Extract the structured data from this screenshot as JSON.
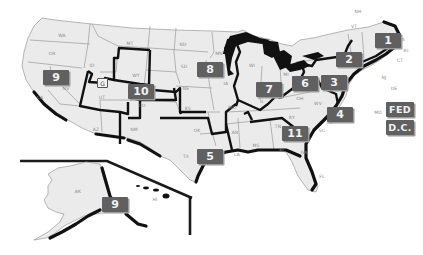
{
  "map": {
    "type": "US regional map",
    "colors": {
      "background": "#ffffff",
      "state_fill": "#ebebeb",
      "state_border": "#9a9a9a",
      "region_border": "#111111",
      "badge_fill": "#606060",
      "badge_text": "#f2f2f2"
    },
    "regions": [
      {
        "id": "1",
        "label": "1"
      },
      {
        "id": "2",
        "label": "2"
      },
      {
        "id": "3",
        "label": "3"
      },
      {
        "id": "4",
        "label": "4"
      },
      {
        "id": "5",
        "label": "5"
      },
      {
        "id": "6",
        "label": "6"
      },
      {
        "id": "7",
        "label": "7"
      },
      {
        "id": "8",
        "label": "8"
      },
      {
        "id": "9",
        "label": "9"
      },
      {
        "id": "9-alaska",
        "label": "9"
      },
      {
        "id": "10",
        "label": "10"
      },
      {
        "id": "11",
        "label": "11"
      },
      {
        "id": "fed",
        "label": "FED"
      },
      {
        "id": "dc",
        "label": "D.C."
      }
    ],
    "small_box_label": "G",
    "state_labels": {
      "WA": "WA",
      "OR": "OR",
      "CA": "CA",
      "NV": "NV",
      "ID": "ID",
      "MT": "MT",
      "WY": "WY",
      "UT": "UT",
      "AZ": "AZ",
      "CO": "CO",
      "NM": "NM",
      "ND": "ND",
      "SD": "SD",
      "NE": "NE",
      "KS": "KS",
      "OK": "OK",
      "TX": "TX",
      "MN": "MN",
      "IA": "IA",
      "MO": "MO",
      "AR": "AR",
      "LA": "LA",
      "WI": "WI",
      "IL": "IL",
      "MS": "MS",
      "MI": "MI",
      "IN": "IN",
      "KY": "KY",
      "TN": "TN",
      "AL": "AL",
      "GA": "GA",
      "FL": "FL",
      "OH": "OH",
      "WV": "WV",
      "VA": "VA",
      "NC": "NC",
      "SC": "SC",
      "PA": "PA",
      "NY": "NY",
      "VT": "VT",
      "NH": "NH",
      "ME": "ME",
      "MA": "MA",
      "RI": "RI",
      "CT": "CT",
      "NJ": "NJ",
      "DE": "DE",
      "MD": "MD",
      "AK": "AK",
      "HI": "HI"
    }
  }
}
